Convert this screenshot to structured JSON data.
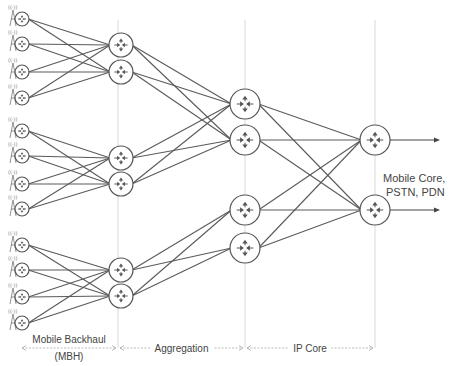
{
  "diagram": {
    "colors": {
      "link": "#5a5a5a",
      "node_stroke": "#555555",
      "divider": "#cfcfcf",
      "text": "#444444"
    },
    "cell_sites": [
      {
        "id": "S1",
        "x": 22,
        "y": 19
      },
      {
        "id": "S2",
        "x": 22,
        "y": 44
      },
      {
        "id": "S3",
        "x": 22,
        "y": 72
      },
      {
        "id": "S4",
        "x": 22,
        "y": 98
      },
      {
        "id": "S5",
        "x": 22,
        "y": 131
      },
      {
        "id": "S6",
        "x": 22,
        "y": 156
      },
      {
        "id": "S7",
        "x": 22,
        "y": 184
      },
      {
        "id": "S8",
        "x": 22,
        "y": 209
      },
      {
        "id": "S9",
        "x": 22,
        "y": 245
      },
      {
        "id": "S10",
        "x": 22,
        "y": 270
      },
      {
        "id": "S11",
        "x": 22,
        "y": 297
      },
      {
        "id": "S12",
        "x": 22,
        "y": 323
      }
    ],
    "cell_radio_label": "((·))",
    "aggregation_routers": [
      {
        "id": "A1",
        "x": 121,
        "y": 45
      },
      {
        "id": "A2",
        "x": 121,
        "y": 72
      },
      {
        "id": "A3",
        "x": 121,
        "y": 158
      },
      {
        "id": "A4",
        "x": 121,
        "y": 184
      },
      {
        "id": "A5",
        "x": 121,
        "y": 270
      },
      {
        "id": "A6",
        "x": 121,
        "y": 296
      }
    ],
    "core_routers": [
      {
        "id": "C1",
        "x": 245,
        "y": 104
      },
      {
        "id": "C2",
        "x": 245,
        "y": 140
      },
      {
        "id": "C3",
        "x": 245,
        "y": 210
      },
      {
        "id": "C4",
        "x": 245,
        "y": 248
      }
    ],
    "edge_routers": [
      {
        "id": "E1",
        "x": 375,
        "y": 140
      },
      {
        "id": "E2",
        "x": 375,
        "y": 210
      }
    ],
    "links": [
      [
        "S1",
        "A1"
      ],
      [
        "S1",
        "A2"
      ],
      [
        "S2",
        "A1"
      ],
      [
        "S2",
        "A2"
      ],
      [
        "S3",
        "A1"
      ],
      [
        "S3",
        "A2"
      ],
      [
        "S4",
        "A1"
      ],
      [
        "S4",
        "A2"
      ],
      [
        "S5",
        "A3"
      ],
      [
        "S5",
        "A4"
      ],
      [
        "S6",
        "A3"
      ],
      [
        "S6",
        "A4"
      ],
      [
        "S7",
        "A3"
      ],
      [
        "S7",
        "A4"
      ],
      [
        "S8",
        "A3"
      ],
      [
        "S8",
        "A4"
      ],
      [
        "S9",
        "A5"
      ],
      [
        "S9",
        "A6"
      ],
      [
        "S10",
        "A5"
      ],
      [
        "S10",
        "A6"
      ],
      [
        "S11",
        "A5"
      ],
      [
        "S11",
        "A6"
      ],
      [
        "S12",
        "A5"
      ],
      [
        "S12",
        "A6"
      ],
      [
        "A1",
        "C1"
      ],
      [
        "A1",
        "C2"
      ],
      [
        "A2",
        "C1"
      ],
      [
        "A2",
        "C2"
      ],
      [
        "A3",
        "C1"
      ],
      [
        "A3",
        "C2"
      ],
      [
        "A4",
        "C1"
      ],
      [
        "A4",
        "C2"
      ],
      [
        "A5",
        "C3"
      ],
      [
        "A5",
        "C4"
      ],
      [
        "A6",
        "C3"
      ],
      [
        "A6",
        "C4"
      ],
      [
        "C1",
        "E1"
      ],
      [
        "C1",
        "E2"
      ],
      [
        "C2",
        "E1"
      ],
      [
        "C2",
        "E2"
      ],
      [
        "C3",
        "E1"
      ],
      [
        "C3",
        "E2"
      ],
      [
        "C4",
        "E1"
      ],
      [
        "C4",
        "E2"
      ]
    ],
    "dividers": [
      118,
      245,
      375
    ],
    "outputs": {
      "label_line1": "Mobile Core,",
      "label_line2": "PSTN, PDN",
      "arrow_end_x": 440
    },
    "segments": [
      {
        "name": "mbh",
        "label_line1": "Mobile Backhaul",
        "label_line2": "(MBH)",
        "x1": 20,
        "x2": 118
      },
      {
        "name": "aggregation",
        "label_line1": "Aggregation",
        "label_line2": "",
        "x1": 118,
        "x2": 245
      },
      {
        "name": "ip-core",
        "label_line1": "IP Core",
        "label_line2": "",
        "x1": 245,
        "x2": 375
      }
    ]
  }
}
